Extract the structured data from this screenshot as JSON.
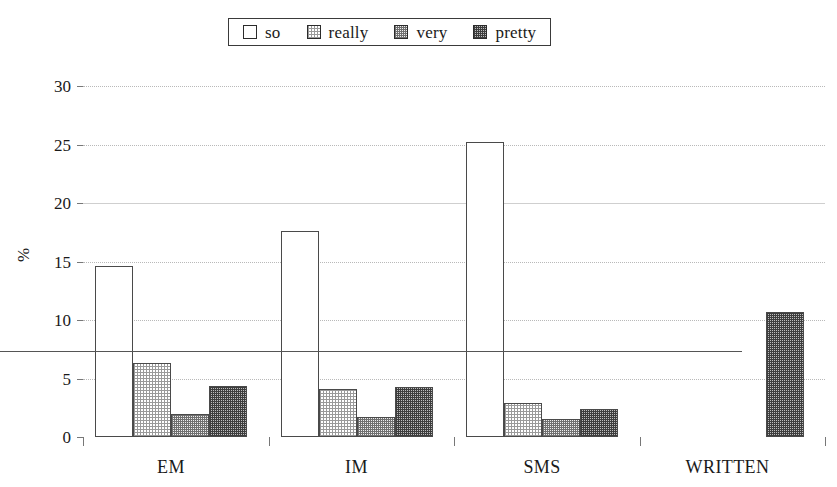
{
  "chart_data": {
    "type": "bar",
    "title": "",
    "xlabel": "",
    "ylabel": "%",
    "ylim": [
      0,
      30
    ],
    "yticks": [
      0,
      5,
      10,
      15,
      20,
      25,
      30
    ],
    "ytick_labels": [
      "0",
      "5",
      "10",
      "15",
      "20",
      "25",
      "30"
    ],
    "grid": true,
    "legend_position": "top-center",
    "categories": [
      "EM",
      "IM",
      "SMS",
      "WRITTEN"
    ],
    "series": [
      {
        "name": "so",
        "values": [
          14.6,
          17.6,
          25.2,
          0
        ],
        "swatch": "fill-so"
      },
      {
        "name": "really",
        "values": [
          6.3,
          4.1,
          2.9,
          0
        ],
        "swatch": "fill-really"
      },
      {
        "name": "very",
        "values": [
          2.0,
          1.7,
          1.5,
          0
        ],
        "swatch": "fill-very"
      },
      {
        "name": "pretty",
        "values": [
          4.4,
          4.3,
          2.4,
          10.7
        ],
        "swatch": "fill-pretty"
      }
    ]
  },
  "legend": {
    "entries": [
      {
        "label": "so"
      },
      {
        "label": "really"
      },
      {
        "label": "very"
      },
      {
        "label": "pretty"
      }
    ]
  },
  "axis": {
    "y_title": "%"
  }
}
